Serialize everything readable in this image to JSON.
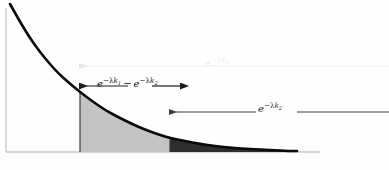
{
  "figure": {
    "background_color": "#fefefe",
    "axis_color": "#c9c9c9",
    "curve_color": "#0a0a0a",
    "region_light_color": "#c3c3c3",
    "region_dark_color": "#2e2e2e",
    "divider_color": "#3c3c3c"
  },
  "annotations": {
    "top": {
      "name": "e to the minus lambda k one",
      "base": "e",
      "exponent_prefix": "−λ",
      "exponent_var": "k",
      "exponent_sub": "1",
      "color": "#ededed",
      "arrow_direction": "left",
      "arrow_from_x": 389,
      "arrow_to_x": 80,
      "arrow_y": 66
    },
    "middle": {
      "name": "difference of exponentials",
      "left": {
        "base": "e",
        "exponent_prefix": "−λ",
        "exponent_var": "k",
        "exponent_sub": "1"
      },
      "operator": "−",
      "right": {
        "base": "e",
        "exponent_prefix": "−λ",
        "exponent_var": "k",
        "exponent_sub": "2"
      },
      "color": "#0d0d0d",
      "arrow_direction": "both",
      "arrow_from_x": 80,
      "arrow_to_x": 181,
      "arrow_y": 86
    },
    "bottom": {
      "name": "e to the minus lambda k two",
      "base": "e",
      "exponent_prefix": "−λ",
      "exponent_var": "k",
      "exponent_sub": "2",
      "color": "#2a2a2a",
      "arrow_direction": "left",
      "arrow_from_x": 389,
      "arrow_to_x": 170,
      "arrow_y": 112
    }
  },
  "chart_data": {
    "type": "area",
    "title": "",
    "xlabel": "",
    "ylabel": "",
    "function": "y = exp(-lambda * x)",
    "curve_description": "Monotonically decreasing exponential decay curve drawn in heavy black from upper-left to lower-right, asymptotically approaching the horizontal axis.",
    "axes": {
      "x_axis": {
        "x_start": 6,
        "x_end": 320,
        "y": 152,
        "visible": true,
        "color": "#c9c9c9"
      },
      "y_axis": {
        "x": 6,
        "y_start": 8,
        "y_end": 152,
        "visible": true,
        "color": "#c9c9c9"
      },
      "grid": false,
      "tick_labels_x": [],
      "tick_labels_y": []
    },
    "curve_points": [
      [
        10,
        4
      ],
      [
        14,
        11
      ],
      [
        19,
        20
      ],
      [
        25,
        30
      ],
      [
        32,
        41
      ],
      [
        40,
        52
      ],
      [
        49,
        63
      ],
      [
        58,
        73
      ],
      [
        68,
        82
      ],
      [
        80,
        92
      ],
      [
        92,
        101
      ],
      [
        105,
        110
      ],
      [
        118,
        117
      ],
      [
        132,
        124
      ],
      [
        146,
        130
      ],
      [
        160,
        135
      ],
      [
        170,
        138
      ],
      [
        185,
        141
      ],
      [
        200,
        144
      ],
      [
        215,
        146
      ],
      [
        232,
        148
      ],
      [
        250,
        149
      ],
      [
        270,
        150
      ],
      [
        290,
        151
      ],
      [
        297,
        151
      ]
    ],
    "regions": [
      {
        "name": "light-region",
        "label": "e^{-lambda k_1} - e^{-lambda k_2}",
        "fill": "#c3c3c3",
        "x_start": 80,
        "x_end": 170,
        "description": "Light gray shaded band under the curve between k1 and k2"
      },
      {
        "name": "dark-region",
        "label": "e^{-lambda k_2}",
        "fill": "#2e2e2e",
        "x_start": 170,
        "x_end": 297,
        "description": "Dark gray shaded tail under the curve beyond k2"
      }
    ],
    "markers": [
      {
        "name": "k1-divider",
        "x": 80,
        "y_top": 92,
        "y_bottom": 152,
        "color": "#3c3c3c"
      },
      {
        "name": "k2-divider",
        "x": 170,
        "y_top": 138,
        "y_bottom": 152,
        "color": "#3c3c3c"
      }
    ],
    "legend": {
      "visible": false,
      "position": "none"
    }
  }
}
